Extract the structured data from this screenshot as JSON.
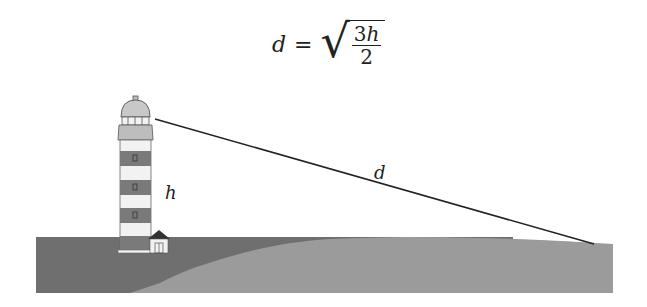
{
  "formula": {
    "lhs": "d",
    "equals": "=",
    "numerator_coef": "3",
    "numerator_var": "h",
    "denominator": "2"
  },
  "labels": {
    "height": "h",
    "distance": "d"
  },
  "colors": {
    "sea_dark": "#6f6f6f",
    "land_light": "#9b9b9b",
    "stripe_dark": "#7a7a7a",
    "stripe_light": "#f2f2f2",
    "lantern": "#c8c8c8",
    "line": "#222222"
  }
}
